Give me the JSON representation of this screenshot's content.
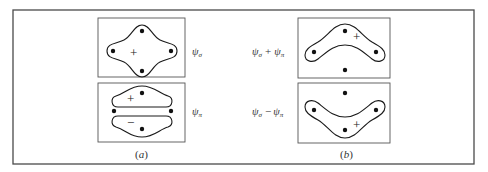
{
  "figure": {
    "panels": [
      {
        "id": "a",
        "caption": "(a)",
        "caption_letter": "a",
        "sub_diagrams": [
          {
            "label": "ψσ",
            "label_parts": {
              "symbol": "ψ",
              "sub": "σ"
            },
            "signs": [
              "+"
            ],
            "description": "four-lobed orbital enclosing all four atoms"
          },
          {
            "label": "ψπ",
            "label_parts": {
              "symbol": "ψ",
              "sub": "π"
            },
            "signs": [
              "+",
              "−"
            ],
            "description": "upper and lower lobes separated by a nodal plane through the side atoms"
          }
        ]
      },
      {
        "id": "b",
        "caption": "(b)",
        "caption_letter": "b",
        "sub_diagrams": [
          {
            "label": "ψσ + ψπ",
            "label_parts": {
              "a_symbol": "ψ",
              "a_sub": "σ",
              "op": "+",
              "b_symbol": "ψ",
              "b_sub": "π"
            },
            "signs": [
              "+"
            ],
            "description": "banana-shaped orbital bridging the top three atoms"
          },
          {
            "label": "ψσ − ψπ",
            "label_parts": {
              "a_symbol": "ψ",
              "a_sub": "σ",
              "op": "−",
              "b_symbol": "ψ",
              "b_sub": "π"
            },
            "signs": [
              "+"
            ],
            "description": "banana-shaped orbital bridging the bottom three atoms"
          }
        ]
      }
    ],
    "colors": {
      "background": "#ffffff",
      "line": "#1a1a1a",
      "frame": "#4a4a4a"
    }
  }
}
